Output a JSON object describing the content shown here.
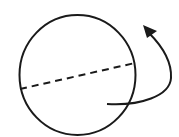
{
  "diagram": {
    "elements": [
      {
        "type": "circle",
        "name": "sphere-outline"
      },
      {
        "type": "dashed-line",
        "name": "equator-line"
      },
      {
        "type": "curved-arrow",
        "name": "rotation-arrow",
        "direction": "counterclockwise-up"
      }
    ],
    "colors": {
      "stroke": "#1a1a1a",
      "background": "#ffffff"
    }
  }
}
